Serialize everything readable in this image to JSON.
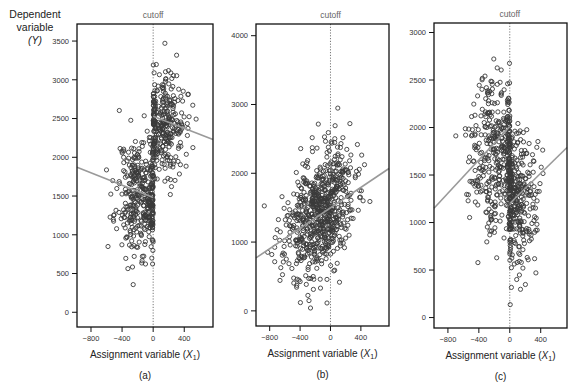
{
  "figure": {
    "ylabel_line1": "Dependent",
    "ylabel_line2": "variable",
    "ylabel_symbol": "(Y)"
  },
  "chart_data": [
    {
      "type": "scatter",
      "panel_label": "(a)",
      "title": "cutoff",
      "xlabel": "Assignment variable (X1)",
      "xlabel_main": "Assignment variable (",
      "xlabel_sym": "X",
      "xlabel_sub": "1",
      "xlabel_close": ")",
      "ylabel": "Dependent variable (Y)",
      "xlim": [
        -980,
        770
      ],
      "ylim": [
        -190,
        3720
      ],
      "xticks": [
        -800,
        -400,
        0,
        400
      ],
      "xtick_labels": [
        "−800",
        "−400",
        "0",
        "400"
      ],
      "yticks": [
        0,
        500,
        1000,
        1500,
        2000,
        2500,
        3000,
        3500
      ],
      "ytick_labels": [
        "0",
        "500",
        "1000",
        "1500",
        "2000",
        "2500",
        "3000",
        "3500"
      ],
      "cutoff_x": 0,
      "grid": false,
      "n_points": 700,
      "seed": 11,
      "clusters": [
        {
          "x_mean": -150,
          "x_sd": 160,
          "y_mean": 1500,
          "y_sd": 380,
          "weight": 0.55,
          "xmax": 0
        },
        {
          "x_mean": 120,
          "x_sd": 140,
          "y_mean": 2450,
          "y_sd": 330,
          "weight": 0.45,
          "xmin": 0
        }
      ],
      "fit_lines": [
        {
          "x": [
            -980,
            0
          ],
          "y": [
            1870,
            1480
          ]
        },
        {
          "x": [
            0,
            770
          ],
          "y": [
            2530,
            2230
          ]
        }
      ]
    },
    {
      "type": "scatter",
      "panel_label": "(b)",
      "title": "cutoff",
      "xlabel": "Assignment variable (X1)",
      "xlabel_main": "Assignment variable (",
      "xlabel_sym": "X",
      "xlabel_sub": "1",
      "xlabel_close": ")",
      "ylabel": "Dependent variable (Y)",
      "xlim": [
        -980,
        770
      ],
      "ylim": [
        -220,
        4170
      ],
      "xticks": [
        -800,
        -400,
        0,
        400
      ],
      "xtick_labels": [
        "−800",
        "−400",
        "0",
        "400"
      ],
      "yticks": [
        0,
        1000,
        2000,
        3000,
        4000
      ],
      "ytick_labels": [
        "0",
        "1000",
        "2000",
        "3000",
        "4000"
      ],
      "cutoff_x": 0,
      "grid": false,
      "n_points": 700,
      "seed": 23,
      "clusters": [
        {
          "x_mean": -150,
          "x_sd": 230,
          "y_mean": 1400,
          "y_sd": 430,
          "weight": 1.0,
          "slope": 0.75
        }
      ],
      "fit_lines": [
        {
          "x": [
            -980,
            770
          ],
          "y": [
            770,
            2070
          ]
        }
      ]
    },
    {
      "type": "scatter",
      "panel_label": "(c)",
      "title": "cutoff",
      "xlabel": "Assignment variable (X1)",
      "xlabel_main": "Assignment variable (",
      "xlabel_sym": "X",
      "xlabel_sub": "1",
      "xlabel_close": ")",
      "ylabel": "Dependent variable (Y)",
      "xlim": [
        -980,
        740
      ],
      "ylim": [
        -110,
        3100
      ],
      "xticks": [
        -800,
        -400,
        0,
        400
      ],
      "xtick_labels": [
        "−800",
        "−400",
        "0",
        "400"
      ],
      "yticks": [
        0,
        500,
        1000,
        1500,
        2000,
        2500,
        3000
      ],
      "ytick_labels": [
        "0",
        "500",
        "1000",
        "1500",
        "2000",
        "2500",
        "3000"
      ],
      "cutoff_x": 0,
      "grid": false,
      "n_points": 700,
      "seed": 37,
      "clusters": [
        {
          "x_mean": -170,
          "x_sd": 170,
          "y_mean": 1750,
          "y_sd": 400,
          "weight": 0.55,
          "xmax": 0
        },
        {
          "x_mean": 110,
          "x_sd": 130,
          "y_mean": 1250,
          "y_sd": 380,
          "weight": 0.45,
          "xmin": 0
        }
      ],
      "fit_lines": [
        {
          "x": [
            -980,
            0
          ],
          "y": [
            1150,
            2010
          ]
        },
        {
          "x": [
            0,
            740
          ],
          "y": [
            1200,
            1790
          ]
        }
      ]
    }
  ]
}
